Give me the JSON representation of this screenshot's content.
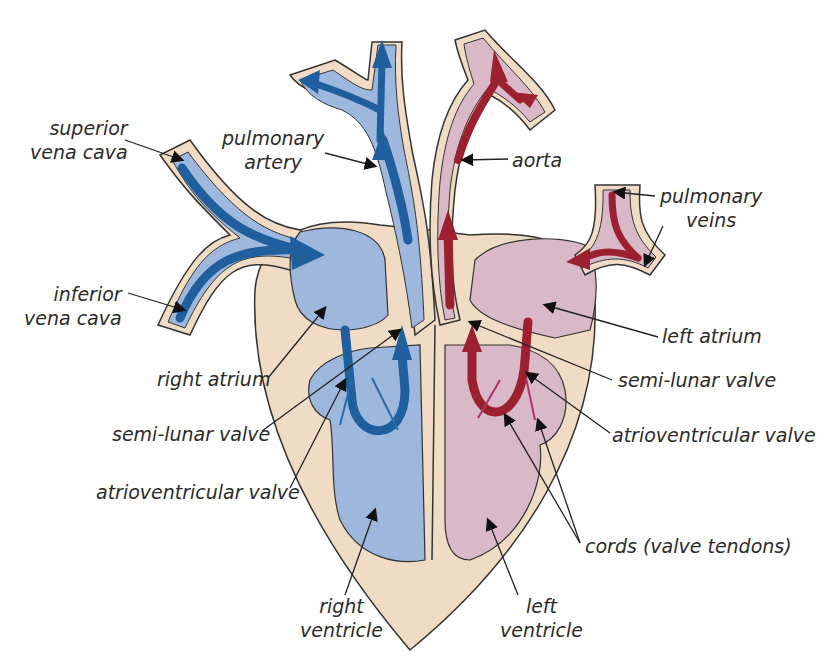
{
  "diagram": {
    "colors": {
      "tissue": "#f0dcc4",
      "deoxygenated_fill": "#9db8dc",
      "deoxygenated_arrow": "#1f5f9e",
      "oxygenated_fill": "#d9b8c8",
      "oxygenated_arrow": "#9c2030",
      "outline": "#333333",
      "label_text": "#2b2b2b"
    },
    "labels": {
      "superior_vena_cava": [
        "superior",
        "vena cava"
      ],
      "inferior_vena_cava": [
        "inferior",
        "vena cava"
      ],
      "pulmonary_artery": [
        "pulmonary",
        "artery"
      ],
      "aorta": [
        "aorta"
      ],
      "pulmonary_veins": [
        "pulmonary",
        "veins"
      ],
      "left_atrium": [
        "left atrium"
      ],
      "right_atrium": [
        "right atrium"
      ],
      "semi_lunar_valve_right": [
        "semi-lunar valve"
      ],
      "semi_lunar_valve_left": [
        "semi-lunar valve"
      ],
      "atrioventricular_valve_right": [
        "atrioventricular valve"
      ],
      "atrioventricular_valve_left": [
        "atrioventricular valve"
      ],
      "cords": [
        "cords (valve tendons)"
      ],
      "right_ventricle": [
        "right",
        "ventricle"
      ],
      "left_ventricle": [
        "left",
        "ventricle"
      ]
    },
    "leader_lines": [
      {
        "name": "superior-vena-cava-pointer",
        "x1": 125,
        "y1": 140,
        "x2": 182,
        "y2": 160
      },
      {
        "name": "inferior-vena-cava-pointer",
        "x1": 128,
        "y1": 293,
        "x2": 184,
        "y2": 310
      },
      {
        "name": "pulmonary-artery-pointer",
        "x1": 325,
        "y1": 153,
        "x2": 375,
        "y2": 166
      },
      {
        "name": "aorta-pointer",
        "x1": 508,
        "y1": 159,
        "x2": 463,
        "y2": 160
      },
      {
        "name": "pulmonary-veins-pointer-1",
        "x1": 655,
        "y1": 196,
        "x2": 615,
        "y2": 192
      },
      {
        "name": "pulmonary-veins-pointer-2",
        "x1": 663,
        "y1": 226,
        "x2": 645,
        "y2": 265
      },
      {
        "name": "left-atrium-pointer",
        "x1": 658,
        "y1": 337,
        "x2": 545,
        "y2": 305
      },
      {
        "name": "right-atrium-pointer",
        "x1": 268,
        "y1": 378,
        "x2": 325,
        "y2": 308
      },
      {
        "name": "semi-lunar-valve-left-pointer",
        "x1": 612,
        "y1": 380,
        "x2": 470,
        "y2": 322
      },
      {
        "name": "semi-lunar-valve-right-pointer",
        "x1": 262,
        "y1": 431,
        "x2": 400,
        "y2": 330
      },
      {
        "name": "atrioventricular-valve-left-pointer",
        "x1": 610,
        "y1": 433,
        "x2": 527,
        "y2": 373
      },
      {
        "name": "atrioventricular-valve-right-pointer",
        "x1": 290,
        "y1": 488,
        "x2": 345,
        "y2": 380
      },
      {
        "name": "cords-pointer-1",
        "x1": 580,
        "y1": 543,
        "x2": 505,
        "y2": 415
      },
      {
        "name": "cords-pointer-2",
        "x1": 580,
        "y1": 543,
        "x2": 538,
        "y2": 420
      },
      {
        "name": "right-ventricle-pointer",
        "x1": 345,
        "y1": 595,
        "x2": 375,
        "y2": 510
      },
      {
        "name": "left-ventricle-pointer",
        "x1": 518,
        "y1": 595,
        "x2": 488,
        "y2": 520
      }
    ]
  }
}
